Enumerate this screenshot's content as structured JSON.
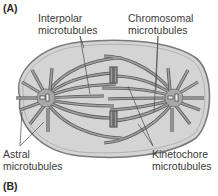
{
  "figure": {
    "panel_a_label": "(A)",
    "panel_b_label": "(B)",
    "labels": {
      "interpolar": {
        "line1": "Interpolar",
        "line2": "microtubules"
      },
      "chromosomal": {
        "line1": "Chromosomal",
        "line2": "microtubules"
      },
      "astral": {
        "line1": "Astral",
        "line2": "microtubules"
      },
      "kinetochore": {
        "line1": "Kinetochore",
        "line2": "microtubules"
      }
    },
    "colors": {
      "cell_fill": "#d4d4d4",
      "cell_outline": "#7a7a7a",
      "microtubule": "#8c8c8c",
      "microtubule_edge": "#5a5a5a",
      "centrosome": "#a8a8a8",
      "leader_line": "#5a5a5a"
    }
  }
}
